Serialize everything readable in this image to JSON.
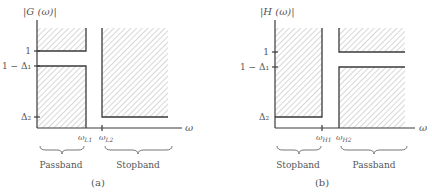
{
  "panels": [
    {
      "id": "a",
      "y_label": "|G (ω)|",
      "x_label": "ω",
      "y_ticks": [
        "1",
        "1 − Δ₁",
        "Δ₂"
      ],
      "x_ticks": [
        "ω_L1",
        "ω_L2"
      ],
      "x_tick_display": [
        {
          "base": "ω",
          "sub": "L1"
        },
        {
          "base": "ω",
          "sub": "L2"
        }
      ],
      "band_labels": [
        "Passband",
        "Stopband"
      ],
      "caption": "(a)",
      "filter_type": "lowpass"
    },
    {
      "id": "b",
      "y_label": "|H (ω)|",
      "x_label": "ω",
      "y_ticks": [
        "1",
        "1 − Δ₁",
        "Δ₂"
      ],
      "x_ticks": [
        "ω_H1",
        "ω_H2"
      ],
      "x_tick_display": [
        {
          "base": "ω",
          "sub": "H1"
        },
        {
          "base": "ω",
          "sub": "H2"
        }
      ],
      "band_labels": [
        "Stopband",
        "Passband"
      ],
      "caption": "(b)",
      "filter_type": "highpass"
    }
  ],
  "colors": {
    "hatch": "#b5b5b5",
    "edge": "#3a3a3a",
    "text": "#555555"
  }
}
